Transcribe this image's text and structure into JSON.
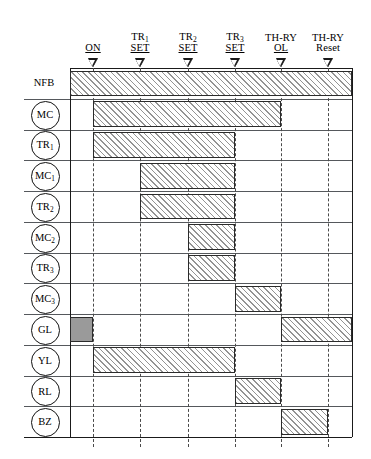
{
  "diagram": {
    "type": "timing-sequence-chart",
    "accent_color": "#000000",
    "bar_hatch_color": "#6b6b6b",
    "bar_border_color": "#2b2b2b",
    "bar_solid_color": "#9a9a9a",
    "grid_line_color": "#55585c"
  },
  "columns": [
    {
      "id": "on",
      "label_top": "",
      "label_bottom": "ON",
      "sub_top": "",
      "x": 93,
      "underline": true
    },
    {
      "id": "tr1_set",
      "label_top": "TR",
      "label_bottom": "SET",
      "sub_top": "1",
      "x": 140,
      "underline": true
    },
    {
      "id": "tr2_set",
      "label_top": "TR",
      "label_bottom": "SET",
      "sub_top": "2",
      "x": 188,
      "underline": true
    },
    {
      "id": "tr3_set",
      "label_top": "TR",
      "label_bottom": "SET",
      "sub_top": "3",
      "x": 235,
      "underline": true
    },
    {
      "id": "thry_ol",
      "label_top": "TH-RY",
      "label_bottom": "OL",
      "sub_top": "",
      "x": 281,
      "underline": true
    },
    {
      "id": "thry_reset",
      "label_top": "TH-RY",
      "label_bottom": "Reset",
      "sub_top": "",
      "x": 328,
      "underline": false
    }
  ],
  "rows": [
    {
      "id": "nfb",
      "label": "NFB",
      "sub": "",
      "circled": false
    },
    {
      "id": "mc",
      "label": "MC",
      "sub": "",
      "circled": true
    },
    {
      "id": "tr1",
      "label": "TR",
      "sub": "1",
      "circled": true
    },
    {
      "id": "mc1",
      "label": "MC",
      "sub": "1",
      "circled": true
    },
    {
      "id": "tr2",
      "label": "TR",
      "sub": "2",
      "circled": true
    },
    {
      "id": "mc2",
      "label": "MC",
      "sub": "2",
      "circled": true
    },
    {
      "id": "tr3",
      "label": "TR",
      "sub": "3",
      "circled": true
    },
    {
      "id": "mc3",
      "label": "MC",
      "sub": "3",
      "circled": true
    },
    {
      "id": "gl",
      "label": "GL",
      "sub": "",
      "circled": true
    },
    {
      "id": "yl",
      "label": "YL",
      "sub": "",
      "circled": true
    },
    {
      "id": "rl",
      "label": "RL",
      "sub": "",
      "circled": true
    },
    {
      "id": "bz",
      "label": "BZ",
      "sub": "",
      "circled": true
    }
  ],
  "chart_data": {
    "type": "timing-bar",
    "title": "",
    "xlabel": "",
    "ylabel": "",
    "x_markers": [
      "ON",
      "TR1 SET",
      "TR2 SET",
      "TR3 SET",
      "TH-RY OL",
      "TH-RY Reset"
    ],
    "x_marker_positions": [
      93,
      140,
      188,
      235,
      281,
      328
    ],
    "plot_left": 70,
    "plot_right": 352,
    "categories": [
      "NFB",
      "MC",
      "TR1",
      "MC1",
      "TR2",
      "MC2",
      "TR3",
      "MC3",
      "GL",
      "YL",
      "RL",
      "BZ"
    ],
    "bars": [
      {
        "row": "nfb",
        "from_x": 70,
        "to_x": 352,
        "style": "hatched",
        "from_marker": "plot-start",
        "to_marker": "plot-end"
      },
      {
        "row": "mc",
        "from_x": 93,
        "to_x": 281,
        "style": "hatched",
        "from_marker": "ON",
        "to_marker": "TH-RY OL"
      },
      {
        "row": "tr1",
        "from_x": 93,
        "to_x": 235,
        "style": "hatched",
        "from_marker": "ON",
        "to_marker": "TR3 SET"
      },
      {
        "row": "mc1",
        "from_x": 140,
        "to_x": 235,
        "style": "hatched",
        "from_marker": "TR1 SET",
        "to_marker": "TR3 SET"
      },
      {
        "row": "tr2",
        "from_x": 140,
        "to_x": 235,
        "style": "hatched",
        "from_marker": "TR1 SET",
        "to_marker": "TR3 SET"
      },
      {
        "row": "mc2",
        "from_x": 188,
        "to_x": 235,
        "style": "hatched",
        "from_marker": "TR2 SET",
        "to_marker": "TR3 SET"
      },
      {
        "row": "tr3",
        "from_x": 188,
        "to_x": 235,
        "style": "hatched",
        "from_marker": "TR2 SET",
        "to_marker": "TR3 SET"
      },
      {
        "row": "mc3",
        "from_x": 235,
        "to_x": 281,
        "style": "hatched",
        "from_marker": "TR3 SET",
        "to_marker": "TH-RY OL"
      },
      {
        "row": "gl",
        "from_x": 70,
        "to_x": 93,
        "style": "solid",
        "from_marker": "plot-start",
        "to_marker": "ON"
      },
      {
        "row": "gl",
        "from_x": 281,
        "to_x": 352,
        "style": "hatched",
        "from_marker": "TH-RY OL",
        "to_marker": "plot-end"
      },
      {
        "row": "yl",
        "from_x": 93,
        "to_x": 235,
        "style": "hatched",
        "from_marker": "ON",
        "to_marker": "TR3 SET"
      },
      {
        "row": "rl",
        "from_x": 235,
        "to_x": 281,
        "style": "hatched",
        "from_marker": "TR3 SET",
        "to_marker": "TH-RY OL"
      },
      {
        "row": "bz",
        "from_x": 281,
        "to_x": 328,
        "style": "hatched",
        "from_marker": "TH-RY OL",
        "to_marker": "TH-RY Reset"
      }
    ]
  },
  "geometry": {
    "plot_left": 70,
    "plot_right": 352,
    "plot_top": 68,
    "row_height": 30.75,
    "row_count": 12,
    "label_line_left": 24,
    "circle_diameter": 27,
    "circle_center_x": 44
  }
}
